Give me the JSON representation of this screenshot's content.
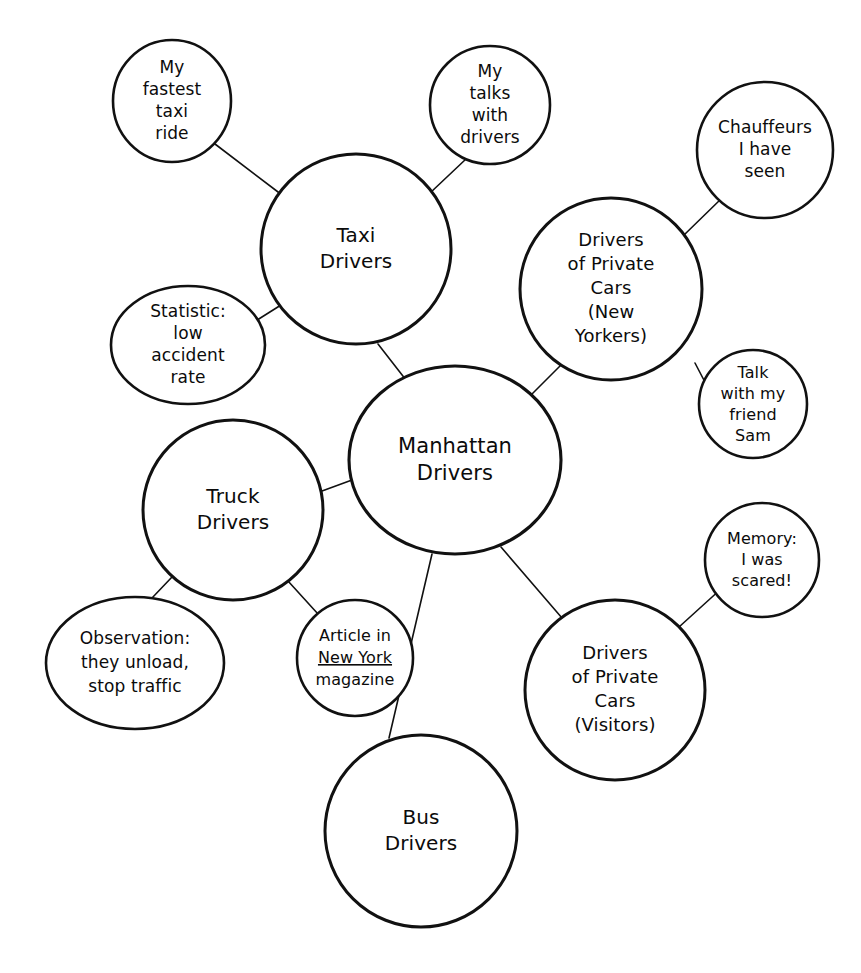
{
  "diagram": {
    "type": "mind-map",
    "background_color": "#ffffff",
    "stroke_color": "#111111",
    "text_color": "#0b0b0b"
  },
  "nodes": [
    {
      "id": "manhattan-drivers",
      "role": "central",
      "cx": 455,
      "cy": 460,
      "rx": 106,
      "ry": 94,
      "font_size": 21,
      "line_height": 27,
      "lines": [
        "Manhattan",
        "Drivers"
      ]
    },
    {
      "id": "taxi-drivers",
      "role": "major",
      "cx": 356,
      "cy": 249,
      "rx": 95,
      "ry": 95,
      "font_size": 20,
      "line_height": 26,
      "lines": [
        "Taxi",
        "Drivers"
      ]
    },
    {
      "id": "drivers-private-cars-new-yorkers",
      "role": "major",
      "cx": 611,
      "cy": 289,
      "rx": 91,
      "ry": 91,
      "font_size": 18,
      "line_height": 24,
      "lines": [
        "Drivers",
        "of Private",
        "Cars",
        "(New",
        "Yorkers)"
      ]
    },
    {
      "id": "truck-drivers",
      "role": "major",
      "cx": 233,
      "cy": 510,
      "rx": 90,
      "ry": 90,
      "font_size": 20,
      "line_height": 26,
      "lines": [
        "Truck",
        "Drivers"
      ]
    },
    {
      "id": "drivers-private-cars-visitors",
      "role": "major",
      "cx": 615,
      "cy": 690,
      "rx": 90,
      "ry": 90,
      "font_size": 18,
      "line_height": 24,
      "lines": [
        "Drivers",
        "of Private",
        "Cars",
        "(Visitors)"
      ]
    },
    {
      "id": "bus-drivers",
      "role": "major",
      "cx": 421,
      "cy": 831,
      "rx": 96,
      "ry": 96,
      "font_size": 20,
      "line_height": 26,
      "lines": [
        "Bus",
        "Drivers"
      ]
    },
    {
      "id": "my-fastest-taxi-ride",
      "role": "leaf",
      "cx": 172,
      "cy": 101,
      "rx": 59,
      "ry": 61,
      "font_size": 17,
      "line_height": 22,
      "lines": [
        "My",
        "fastest",
        "taxi",
        "ride"
      ]
    },
    {
      "id": "my-talks-with-drivers",
      "role": "leaf",
      "cx": 490,
      "cy": 105,
      "rx": 60,
      "ry": 59,
      "font_size": 17,
      "line_height": 22,
      "lines": [
        "My",
        "talks",
        "with",
        "drivers"
      ]
    },
    {
      "id": "chauffeurs-i-have-seen",
      "role": "leaf",
      "cx": 765,
      "cy": 150,
      "rx": 68,
      "ry": 68,
      "font_size": 17,
      "line_height": 22,
      "lines": [
        "Chauffeurs",
        "I have",
        "seen"
      ]
    },
    {
      "id": "statistic-low-accident-rate",
      "role": "leaf",
      "cx": 188,
      "cy": 345,
      "rx": 77,
      "ry": 59,
      "font_size": 17,
      "line_height": 22,
      "lines": [
        "Statistic:",
        "low",
        "accident",
        "rate"
      ]
    },
    {
      "id": "talk-with-my-friend-sam",
      "role": "leaf",
      "cx": 753,
      "cy": 404,
      "rx": 54,
      "ry": 54,
      "font_size": 16,
      "line_height": 21,
      "lines": [
        "Talk",
        "with my",
        "friend",
        "Sam"
      ]
    },
    {
      "id": "memory-i-was-scared",
      "role": "leaf",
      "cx": 762,
      "cy": 560,
      "rx": 57,
      "ry": 57,
      "font_size": 16,
      "line_height": 21,
      "lines": [
        "Memory:",
        "I was",
        "scared!"
      ]
    },
    {
      "id": "observation-they-unload-stop-traffic",
      "role": "leaf",
      "cx": 135,
      "cy": 663,
      "rx": 89,
      "ry": 66,
      "font_size": 17,
      "line_height": 24,
      "lines": [
        "Observation:",
        "they unload,",
        "stop traffic"
      ]
    },
    {
      "id": "article-in-new-york-magazine",
      "role": "leaf",
      "cx": 355,
      "cy": 658,
      "rx": 58,
      "ry": 58,
      "font_size": 16,
      "line_height": 22,
      "lines": [
        "Article in",
        "New York",
        "magazine"
      ],
      "underline_line_index": 1
    }
  ],
  "edges": [
    {
      "id": "edge-manhattan-taxi",
      "from": "manhattan-drivers",
      "to": "taxi-drivers",
      "x1": 406,
      "y1": 380,
      "x2": 378,
      "y2": 344
    },
    {
      "id": "edge-manhattan-privatenew",
      "from": "manhattan-drivers",
      "to": "drivers-private-cars-new-yorkers",
      "x1": 525,
      "y1": 401,
      "x2": 563,
      "y2": 363
    },
    {
      "id": "edge-manhattan-truck",
      "from": "manhattan-drivers",
      "to": "truck-drivers",
      "x1": 352,
      "y1": 480,
      "x2": 322,
      "y2": 491
    },
    {
      "id": "edge-manhattan-privatevis",
      "from": "manhattan-drivers",
      "to": "drivers-private-cars-visitors",
      "x1": 501,
      "y1": 547,
      "x2": 562,
      "y2": 618
    },
    {
      "id": "edge-manhattan-bus",
      "from": "manhattan-drivers",
      "to": "bus-drivers",
      "x1": 432,
      "y1": 554,
      "x2": 389,
      "y2": 738
    },
    {
      "id": "edge-taxi-fastestride",
      "from": "taxi-drivers",
      "to": "my-fastest-taxi-ride",
      "x1": 282,
      "y1": 195,
      "x2": 215,
      "y2": 144
    },
    {
      "id": "edge-taxi-talksdrivers",
      "from": "taxi-drivers",
      "to": "my-talks-with-drivers",
      "x1": 430,
      "y1": 193,
      "x2": 466,
      "y2": 159
    },
    {
      "id": "edge-taxi-statistic",
      "from": "taxi-drivers",
      "to": "statistic-low-accident-rate",
      "x1": 281,
      "y1": 305,
      "x2": 254,
      "y2": 322
    },
    {
      "id": "edge-privatenew-chauffeurs",
      "from": "drivers-private-cars-new-yorkers",
      "to": "chauffeurs-i-have-seen",
      "x1": 684,
      "y1": 235,
      "x2": 722,
      "y2": 198
    },
    {
      "id": "edge-privatenew-sam",
      "from": "drivers-private-cars-new-yorkers",
      "to": "talk-with-my-friend-sam",
      "x1": 695,
      "y1": 363,
      "x2": 707,
      "y2": 386
    },
    {
      "id": "edge-truck-observation",
      "from": "truck-drivers",
      "to": "observation-they-unload-stop-traffic",
      "x1": 172,
      "y1": 577,
      "x2": 152,
      "y2": 598
    },
    {
      "id": "edge-truck-article",
      "from": "truck-drivers",
      "to": "article-in-new-york-magazine",
      "x1": 288,
      "y1": 581,
      "x2": 318,
      "y2": 614
    },
    {
      "id": "edge-privatevis-memory",
      "from": "drivers-private-cars-visitors",
      "to": "memory-i-was-scared",
      "x1": 679,
      "y1": 627,
      "x2": 722,
      "y2": 588
    }
  ]
}
